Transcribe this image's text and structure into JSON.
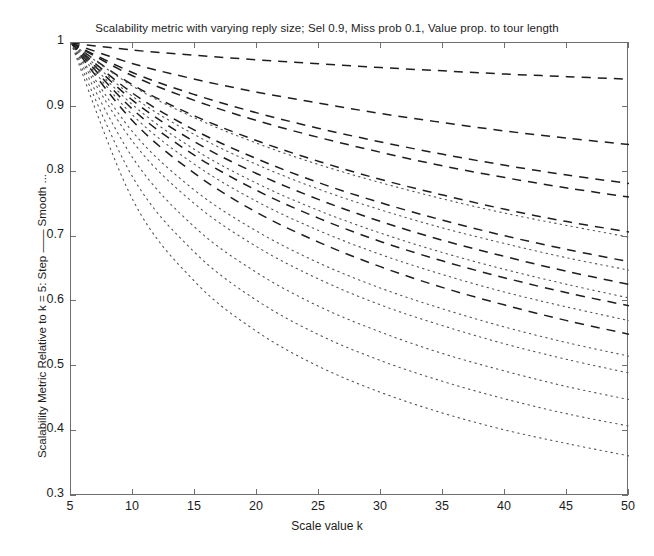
{
  "chart_data": {
    "type": "line",
    "title": "Scalability metric with varying reply size; Sel 0.9, Miss prob 0.1, Value prop. to tour length",
    "xlabel": "Scale value k",
    "ylabel": "Scalability Metric Relative to k = 5: Step —— Smooth ...",
    "xlim": [
      5,
      50
    ],
    "ylim": [
      0.3,
      1
    ],
    "grid": false,
    "legend": "none",
    "legend_note": "Step = dashed line, Smooth = dotted line",
    "xticks": [
      "5",
      "10",
      "15",
      "20",
      "25",
      "30",
      "35",
      "40",
      "45",
      "50"
    ],
    "xtick_values": [
      5,
      10,
      15,
      20,
      25,
      30,
      35,
      40,
      45,
      50
    ],
    "yticks": [
      "0.3",
      "0.4",
      "0.5",
      "0.6",
      "0.7",
      "0.8",
      "0.9",
      "1"
    ],
    "ytick_values": [
      0.3,
      0.4,
      0.5,
      0.6,
      0.7,
      0.8,
      0.9,
      1
    ],
    "x": [
      5,
      10,
      15,
      20,
      25,
      30,
      35,
      40,
      45,
      50
    ],
    "series": [
      {
        "name": "Step reply size 1",
        "style": "dashed",
        "values": [
          1,
          0.989,
          0.981,
          0.974,
          0.968,
          0.962,
          0.957,
          0.952,
          0.948,
          0.944
        ]
      },
      {
        "name": "Step reply size 2",
        "style": "dashed",
        "values": [
          1,
          0.968,
          0.944,
          0.924,
          0.907,
          0.891,
          0.877,
          0.864,
          0.853,
          0.843
        ]
      },
      {
        "name": "Step reply size 3",
        "style": "dashed",
        "values": [
          1,
          0.954,
          0.92,
          0.892,
          0.868,
          0.847,
          0.828,
          0.811,
          0.796,
          0.783
        ]
      },
      {
        "name": "Step reply size 4",
        "style": "dashed",
        "values": [
          1,
          0.949,
          0.911,
          0.88,
          0.854,
          0.831,
          0.81,
          0.792,
          0.776,
          0.762
        ]
      },
      {
        "name": "Step reply size 5",
        "style": "dashed",
        "values": [
          1,
          0.935,
          0.887,
          0.849,
          0.817,
          0.789,
          0.765,
          0.743,
          0.724,
          0.708
        ]
      },
      {
        "name": "Smooth reply size 1",
        "style": "dotted",
        "values": [
          1,
          0.933,
          0.884,
          0.845,
          0.812,
          0.784,
          0.759,
          0.737,
          0.718,
          0.7
        ]
      },
      {
        "name": "Step reply size 6",
        "style": "dashed",
        "values": [
          1,
          0.922,
          0.865,
          0.821,
          0.784,
          0.753,
          0.726,
          0.702,
          0.681,
          0.662
        ]
      },
      {
        "name": "Smooth reply size 2",
        "style": "dotted",
        "values": [
          1,
          0.917,
          0.858,
          0.812,
          0.774,
          0.742,
          0.714,
          0.69,
          0.668,
          0.649
        ]
      },
      {
        "name": "Step reply size 7",
        "style": "dashed",
        "values": [
          1,
          0.911,
          0.847,
          0.798,
          0.758,
          0.724,
          0.695,
          0.67,
          0.647,
          0.627
        ]
      },
      {
        "name": "Smooth reply size 3",
        "style": "dotted",
        "values": [
          1,
          0.904,
          0.835,
          0.783,
          0.741,
          0.706,
          0.676,
          0.65,
          0.627,
          0.606
        ]
      },
      {
        "name": "Step reply size 8",
        "style": "dashed",
        "values": [
          1,
          0.897,
          0.826,
          0.772,
          0.729,
          0.693,
          0.663,
          0.637,
          0.614,
          0.594
        ]
      },
      {
        "name": "Smooth reply size 4",
        "style": "dotted",
        "values": [
          1,
          0.888,
          0.812,
          0.755,
          0.71,
          0.673,
          0.642,
          0.615,
          0.592,
          0.571
        ]
      },
      {
        "name": "Step reply size 9",
        "style": "dashed",
        "values": [
          1,
          0.879,
          0.798,
          0.738,
          0.692,
          0.654,
          0.622,
          0.595,
          0.571,
          0.55
        ]
      },
      {
        "name": "Smooth reply size 5",
        "style": "dotted",
        "values": [
          1,
          0.862,
          0.772,
          0.709,
          0.66,
          0.621,
          0.589,
          0.561,
          0.537,
          0.516
        ]
      },
      {
        "name": "Smooth reply size 6",
        "style": "dotted",
        "values": [
          1,
          0.847,
          0.751,
          0.685,
          0.635,
          0.595,
          0.563,
          0.535,
          0.511,
          0.49
        ]
      },
      {
        "name": "Smooth reply size 7",
        "style": "dotted",
        "values": [
          1,
          0.822,
          0.715,
          0.645,
          0.593,
          0.553,
          0.52,
          0.493,
          0.469,
          0.449
        ]
      },
      {
        "name": "Smooth reply size 8",
        "style": "dotted",
        "values": [
          1,
          0.792,
          0.676,
          0.602,
          0.549,
          0.509,
          0.477,
          0.45,
          0.427,
          0.408
        ]
      },
      {
        "name": "Smooth reply size 9",
        "style": "dotted",
        "values": [
          1,
          0.757,
          0.631,
          0.554,
          0.5,
          0.46,
          0.428,
          0.402,
          0.381,
          0.362
        ]
      }
    ]
  }
}
